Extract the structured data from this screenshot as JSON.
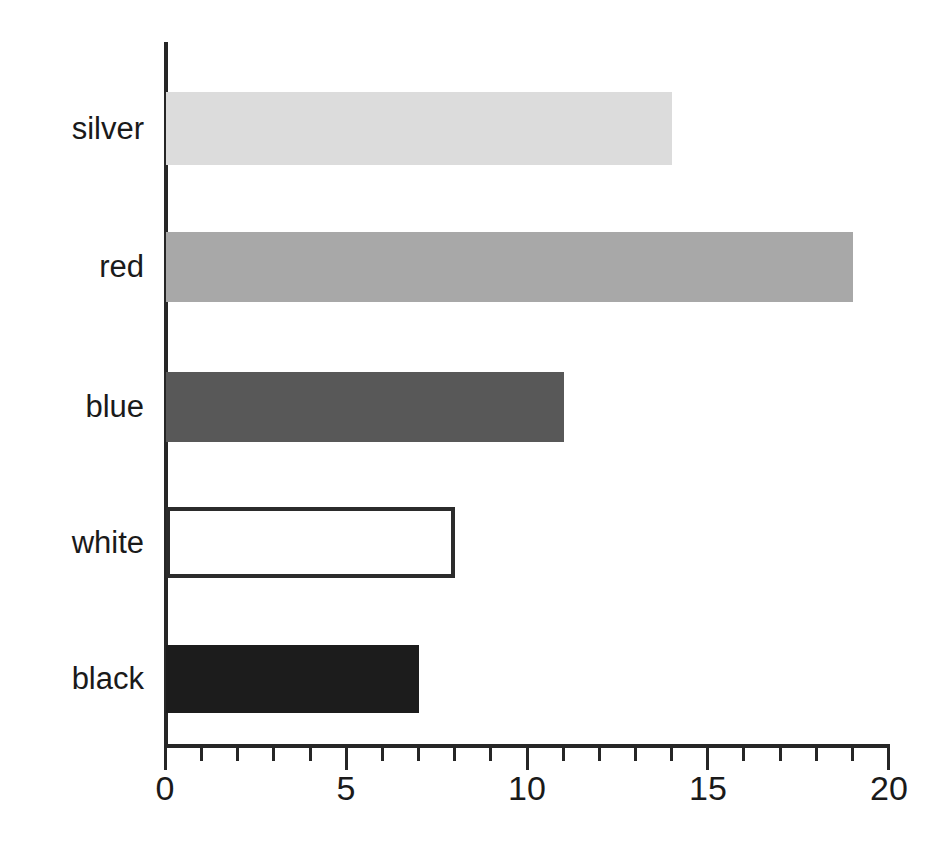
{
  "chart_data": {
    "type": "bar",
    "orientation": "horizontal",
    "title": "",
    "subtitle": "",
    "xlabel": "",
    "ylabel": "",
    "categories": [
      "silver",
      "red",
      "blue",
      "white",
      "black"
    ],
    "values": [
      14,
      19,
      11,
      8,
      7
    ],
    "series": [
      {
        "name": "",
        "values": [
          14,
          19,
          11,
          8,
          7
        ]
      }
    ],
    "xlim": [
      0,
      20
    ],
    "xticks": [
      0,
      5,
      10,
      15,
      20
    ],
    "xtick_labels": [
      "0",
      "5",
      "10",
      "15",
      "20"
    ],
    "minor_tick_interval": 1,
    "grid": false,
    "legend": false,
    "legend_position": "none",
    "bar_styles": [
      {
        "category": "silver",
        "fill": "#dcdcdc",
        "stroke": "none",
        "stroke_width": 0
      },
      {
        "category": "red",
        "fill": "#a8a8a8",
        "stroke": "none",
        "stroke_width": 0
      },
      {
        "category": "blue",
        "fill": "#585858",
        "stroke": "none",
        "stroke_width": 0
      },
      {
        "category": "white",
        "fill": "#ffffff",
        "stroke": "#2b2b2b",
        "stroke_width": 4
      },
      {
        "category": "black",
        "fill": "#1c1c1c",
        "stroke": "none",
        "stroke_width": 0
      }
    ],
    "axis_color": "#262626",
    "text_color": "#1a1a1a",
    "background": "#ffffff"
  },
  "axis": {
    "tick_labels": [
      "0",
      "5",
      "10",
      "15",
      "20"
    ]
  },
  "categories": {
    "silver": "silver",
    "red": "red",
    "blue": "blue",
    "white": "white",
    "black": "black"
  }
}
